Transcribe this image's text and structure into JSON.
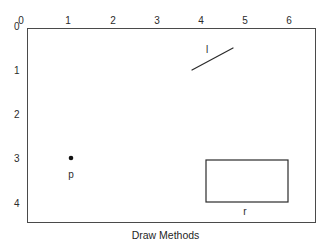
{
  "figure": {
    "caption": "Draw Methods",
    "width": 331,
    "height": 246,
    "background_color": "#ffffff",
    "border_color": "#4a4a4a",
    "ink_color": "#2b2b2b"
  },
  "axes": {
    "x_axis": {
      "label": "",
      "position": "top",
      "ticks": [
        {
          "label": "0",
          "value": 0,
          "px": 21
        },
        {
          "label": "1",
          "value": 1,
          "px": 68
        },
        {
          "label": "2",
          "value": 2,
          "px": 113
        },
        {
          "label": "3",
          "value": 3,
          "px": 157
        },
        {
          "label": "4",
          "value": 4,
          "px": 201
        },
        {
          "label": "5",
          "value": 5,
          "px": 245
        },
        {
          "label": "6",
          "value": 6,
          "px": 289
        }
      ]
    },
    "y_axis": {
      "label": "",
      "position": "left",
      "ticks": [
        {
          "label": "0",
          "value": 0,
          "px": 26
        },
        {
          "label": "1",
          "value": 1,
          "px": 70
        },
        {
          "label": "2",
          "value": 2,
          "px": 114
        },
        {
          "label": "3",
          "value": 3,
          "px": 158
        },
        {
          "label": "4",
          "value": 4,
          "px": 203
        }
      ]
    }
  },
  "shapes": {
    "line": {
      "name": "l",
      "label": "l",
      "label_x": 207,
      "label_y": 49,
      "x1": 192,
      "y1": 70,
      "x2": 233,
      "y2": 48,
      "color": "#2b2b2b",
      "stroke_width": 1.2
    },
    "point": {
      "name": "p",
      "label": "p",
      "label_x": 71,
      "label_y": 174,
      "cx": 71,
      "cy": 158,
      "radius": 2.3,
      "color": "#111111"
    },
    "rectangle": {
      "name": "r",
      "label": "r",
      "label_x": 245,
      "label_y": 211,
      "x": 206,
      "y": 160,
      "width": 82,
      "height": 42,
      "color": "#2b2b2b",
      "stroke_width": 1.2,
      "fill": "none"
    }
  },
  "chart_data": {
    "type": "scatter",
    "title": "Draw Methods",
    "xlabel": "",
    "ylabel": "",
    "xlim": [
      0,
      6.5
    ],
    "ylim": [
      4.4,
      0
    ],
    "grid": false,
    "legend": null,
    "annotations": [
      {
        "type": "line",
        "label": "l",
        "from": [
          3.75,
          0.95
        ],
        "to": [
          4.68,
          0.45
        ]
      },
      {
        "type": "point",
        "label": "p",
        "at": [
          1.0,
          3.0
        ]
      },
      {
        "type": "rect",
        "label": "r",
        "x": 4.06,
        "y": 3.02,
        "width": 1.86,
        "height": 0.95
      }
    ]
  }
}
